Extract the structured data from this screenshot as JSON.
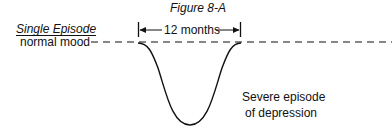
{
  "figure": {
    "title": "Figure 8-A",
    "heading": "Single Episode",
    "baseline_label": "normal mood",
    "duration_label": "12 months",
    "annotation_line1": "Severe episode",
    "annotation_line2": "of depression"
  },
  "colors": {
    "ink": "#111111",
    "background": "#ffffff"
  }
}
